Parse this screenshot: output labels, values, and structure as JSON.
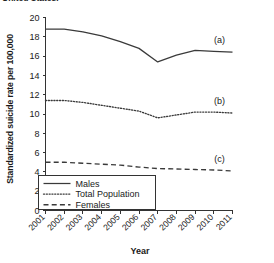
{
  "caption": {
    "text": "United States."
  },
  "chart_data": {
    "type": "line",
    "title": "",
    "xlabel": "Year",
    "ylabel": "Standardized suicide rate per 100,000",
    "categories": [
      "2001",
      "2002",
      "2003",
      "2004",
      "2005",
      "2006",
      "2007",
      "2008",
      "2009",
      "2010",
      "2011"
    ],
    "x": [
      2001,
      2002,
      2003,
      2004,
      2005,
      2006,
      2007,
      2008,
      2009,
      2010,
      2011
    ],
    "xlim": [
      2001,
      2011
    ],
    "ylim": [
      0,
      20
    ],
    "yticks": [
      "0",
      "2",
      "4",
      "6",
      "8",
      "10",
      "12",
      "14",
      "16",
      "18",
      "20"
    ],
    "ytick_values": [
      0,
      2,
      4,
      6,
      8,
      10,
      12,
      14,
      16,
      18,
      20
    ],
    "grid": false,
    "legend_position": "bottom-left",
    "series": [
      {
        "name": "Males",
        "tag": "(a)",
        "style": "solid",
        "values": [
          18.8,
          18.8,
          18.5,
          18.1,
          17.5,
          16.8,
          15.4,
          16.1,
          16.6,
          16.5,
          16.4
        ]
      },
      {
        "name": "Total Population",
        "tag": "(b)",
        "style": "dotted",
        "values": [
          11.4,
          11.4,
          11.2,
          10.9,
          10.6,
          10.3,
          9.6,
          9.9,
          10.2,
          10.2,
          10.1
        ]
      },
      {
        "name": "Females",
        "tag": "(c)",
        "style": "dashed",
        "values": [
          5.0,
          5.0,
          4.9,
          4.8,
          4.7,
          4.5,
          4.35,
          4.3,
          4.25,
          4.2,
          4.1
        ]
      }
    ],
    "annotations": [
      {
        "label": "(a)",
        "series": "Males"
      },
      {
        "label": "(b)",
        "series": "Total Population"
      },
      {
        "label": "(c)",
        "series": "Females"
      }
    ],
    "legend": [
      {
        "label": "Males",
        "style": "solid"
      },
      {
        "label": "Total Population",
        "style": "dotted"
      },
      {
        "label": "Females",
        "style": "dashed"
      }
    ],
    "colors": {
      "line": "#3a3a3a",
      "axis": "#333333",
      "background": "#ffffff"
    }
  }
}
